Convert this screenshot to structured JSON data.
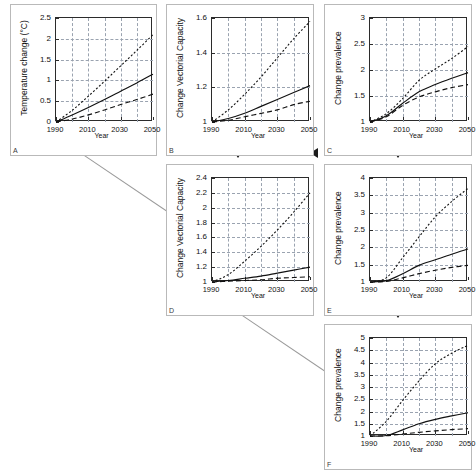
{
  "figure": {
    "panel_labels": [
      "A",
      "B",
      "C",
      "D",
      "E",
      "F"
    ],
    "shared": {
      "xlabel": "Year",
      "xticks": [
        "1990",
        "2010",
        "2030",
        "2050"
      ],
      "xlim": [
        1990,
        2050
      ]
    }
  },
  "chart_data": [
    {
      "id": "A",
      "type": "line",
      "title": "",
      "xlabel": "Year",
      "ylabel": "Temperature change (°C)",
      "xlim": [
        1990,
        2050
      ],
      "ylim": [
        0,
        2.5
      ],
      "yticks": [
        "0",
        "0.5",
        "1",
        "1.5",
        "2",
        "2.5"
      ],
      "xticks": [
        "1990",
        "2010",
        "2030",
        "2050"
      ],
      "grid": true,
      "legend": "none",
      "x": [
        1990,
        2000,
        2010,
        2020,
        2030,
        2040,
        2050
      ],
      "series": [
        {
          "name": "high scenario",
          "style": "dotted",
          "values": [
            0.0,
            0.28,
            0.62,
            0.98,
            1.35,
            1.72,
            2.1
          ]
        },
        {
          "name": "mid scenario",
          "style": "solid",
          "values": [
            0.0,
            0.17,
            0.35,
            0.54,
            0.74,
            0.94,
            1.15
          ]
        },
        {
          "name": "low scenario",
          "style": "dashed",
          "values": [
            0.0,
            0.07,
            0.17,
            0.29,
            0.42,
            0.54,
            0.67
          ]
        }
      ]
    },
    {
      "id": "B",
      "type": "line",
      "title": "",
      "xlabel": "Year",
      "ylabel": "Change Vectorial Capacity",
      "xlim": [
        1990,
        2050
      ],
      "ylim": [
        1,
        1.6
      ],
      "yticks": [
        "1",
        "1.2",
        "1.4",
        "1.6"
      ],
      "xticks": [
        "1990",
        "2010",
        "2030",
        "2050"
      ],
      "grid": true,
      "legend": "none",
      "x": [
        1990,
        2000,
        2010,
        2020,
        2030,
        2040,
        2050
      ],
      "series": [
        {
          "name": "high scenario",
          "style": "dotted",
          "values": [
            1.0,
            1.07,
            1.16,
            1.26,
            1.37,
            1.48,
            1.58
          ]
        },
        {
          "name": "mid scenario",
          "style": "solid",
          "values": [
            1.0,
            1.02,
            1.05,
            1.09,
            1.13,
            1.17,
            1.21
          ]
        },
        {
          "name": "low scenario",
          "style": "dashed",
          "values": [
            1.0,
            1.01,
            1.03,
            1.05,
            1.07,
            1.1,
            1.12
          ]
        }
      ]
    },
    {
      "id": "C",
      "type": "line",
      "title": "",
      "xlabel": "Year",
      "ylabel": "Change prevalence",
      "xlim": [
        1990,
        2050
      ],
      "ylim": [
        1,
        3
      ],
      "yticks": [
        "1",
        "1.5",
        "2",
        "2.5",
        "3"
      ],
      "xticks": [
        "1990",
        "2010",
        "2030",
        "2050"
      ],
      "grid": true,
      "legend": "none",
      "x": [
        1990,
        2000,
        2010,
        2020,
        2030,
        2040,
        2050
      ],
      "series": [
        {
          "name": "high scenario",
          "style": "dotted",
          "values": [
            1.0,
            1.16,
            1.45,
            1.8,
            2.02,
            2.22,
            2.45
          ]
        },
        {
          "name": "mid scenario",
          "style": "solid",
          "values": [
            1.0,
            1.12,
            1.36,
            1.58,
            1.72,
            1.84,
            1.95
          ]
        },
        {
          "name": "low scenario",
          "style": "dashed",
          "values": [
            1.0,
            1.1,
            1.32,
            1.48,
            1.58,
            1.66,
            1.72
          ]
        }
      ]
    },
    {
      "id": "D",
      "type": "line",
      "title": "",
      "xlabel": "Year",
      "ylabel": "Change Vectorial Capacity",
      "xlim": [
        1990,
        2050
      ],
      "ylim": [
        1,
        2.4
      ],
      "yticks": [
        "1",
        "1.2",
        "1.4",
        "1.6",
        "1.8",
        "2",
        "2.2",
        "2.4"
      ],
      "xticks": [
        "1990",
        "2010",
        "2030",
        "2050"
      ],
      "grid": true,
      "legend": "none",
      "x": [
        1990,
        2000,
        2010,
        2020,
        2030,
        2040,
        2050
      ],
      "series": [
        {
          "name": "high scenario",
          "style": "dotted",
          "values": [
            1.0,
            1.1,
            1.28,
            1.48,
            1.7,
            1.94,
            2.2
          ]
        },
        {
          "name": "mid scenario",
          "style": "solid",
          "values": [
            1.0,
            1.02,
            1.05,
            1.08,
            1.12,
            1.16,
            1.2
          ]
        },
        {
          "name": "low scenario",
          "style": "dashed",
          "values": [
            1.0,
            1.01,
            1.02,
            1.03,
            1.05,
            1.06,
            1.07
          ]
        }
      ]
    },
    {
      "id": "E",
      "type": "line",
      "title": "",
      "xlabel": "Year",
      "ylabel": "Change prevalence",
      "xlim": [
        1990,
        2050
      ],
      "ylim": [
        1,
        4
      ],
      "yticks": [
        "1",
        "1.5",
        "2",
        "2.5",
        "3",
        "3.5",
        "4"
      ],
      "xticks": [
        "1990",
        "2010",
        "2030",
        "2050"
      ],
      "grid": true,
      "legend": "none",
      "x": [
        1990,
        2000,
        2010,
        2020,
        2030,
        2040,
        2050
      ],
      "series": [
        {
          "name": "high scenario",
          "style": "dotted",
          "values": [
            1.0,
            1.12,
            1.7,
            2.3,
            2.88,
            3.32,
            3.7
          ]
        },
        {
          "name": "mid scenario",
          "style": "solid",
          "values": [
            1.0,
            1.04,
            1.24,
            1.48,
            1.64,
            1.8,
            1.95
          ]
        },
        {
          "name": "low scenario",
          "style": "dashed",
          "values": [
            1.0,
            1.02,
            1.12,
            1.24,
            1.34,
            1.42,
            1.48
          ]
        }
      ]
    },
    {
      "id": "F",
      "type": "line",
      "title": "",
      "xlabel": "Year",
      "ylabel": "Change prevalence",
      "xlim": [
        1990,
        2050
      ],
      "ylim": [
        1,
        5
      ],
      "yticks": [
        "1",
        "1.5",
        "2",
        "2.5",
        "3",
        "3.5",
        "4",
        "4.5",
        "5"
      ],
      "xticks": [
        "1990",
        "2010",
        "2030",
        "2050"
      ],
      "grid": true,
      "legend": "none",
      "x": [
        1990,
        2000,
        2010,
        2020,
        2030,
        2040,
        2050
      ],
      "series": [
        {
          "name": "high scenario",
          "style": "dotted",
          "values": [
            1.0,
            1.6,
            2.45,
            3.25,
            3.95,
            4.38,
            4.7
          ]
        },
        {
          "name": "mid scenario",
          "style": "solid",
          "values": [
            1.0,
            1.02,
            1.25,
            1.5,
            1.68,
            1.82,
            1.95
          ]
        },
        {
          "name": "low scenario",
          "style": "dashed",
          "values": [
            1.0,
            1.01,
            1.08,
            1.15,
            1.21,
            1.26,
            1.3
          ]
        }
      ]
    }
  ]
}
